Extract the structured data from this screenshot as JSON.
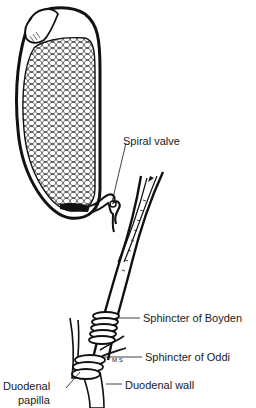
{
  "figure": {
    "colors": {
      "ink": "#111111",
      "background": "#ffffff"
    },
    "labels": [
      {
        "id": "spiral-valve",
        "text": "Spiral valve"
      },
      {
        "id": "sphincter-of-boyden",
        "text": "Sphincter of Boyden"
      },
      {
        "id": "sphincter-of-oddi",
        "text": "Sphincter of Oddi"
      },
      {
        "id": "duodenal-papilla",
        "line1": "Duodenal",
        "line2": "papilla"
      },
      {
        "id": "duodenal-wall",
        "text": "Duodenal wall"
      }
    ],
    "artist_initials": "MS"
  }
}
